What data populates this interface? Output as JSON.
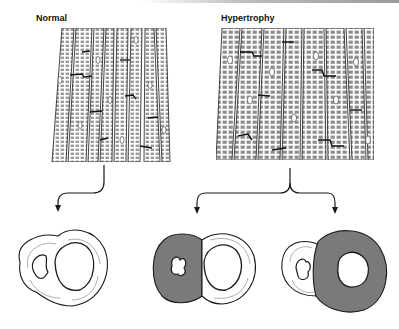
{
  "labels": {
    "normal": "Normal",
    "hypertrophy": "Hypertrophy"
  },
  "colors": {
    "line": "#1a1a1a",
    "hypertrophy_fill": "#7a7a7a",
    "normal_fill": "#ffffff",
    "fiber_fill": "#d9d9d9"
  },
  "panels": [
    {
      "id": "normal-fibers",
      "caption_key": "normal"
    },
    {
      "id": "hypertrophy-fibers",
      "caption_key": "hypertrophy"
    }
  ],
  "cross_sections": [
    {
      "id": "normal-heart",
      "left_ventricle_wall": "normal"
    },
    {
      "id": "concentric-septal-hypertrophy",
      "left_ventricle_wall": "septum thickened"
    },
    {
      "id": "concentric-lv-hypertrophy",
      "left_ventricle_wall": "thickened"
    }
  ]
}
